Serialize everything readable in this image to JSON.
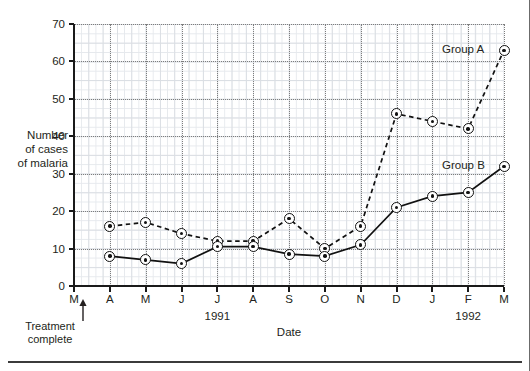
{
  "chart_data": {
    "type": "line",
    "title": "",
    "xlabel": "Date",
    "ylabel": "Number of cases of malaria",
    "ylabel_lines": [
      "Number",
      "of cases",
      "of malaria"
    ],
    "ylim": [
      0,
      70
    ],
    "yticks": [
      0,
      10,
      20,
      30,
      40,
      50,
      60,
      70
    ],
    "grid": true,
    "legend_position": "inline-right",
    "categories": [
      "M",
      "A",
      "M",
      "J",
      "J",
      "A",
      "S",
      "O",
      "N",
      "D",
      "J",
      "F",
      "M"
    ],
    "x": [
      "M",
      "A",
      "M",
      "J",
      "J",
      "A",
      "S",
      "O",
      "N",
      "D",
      "J",
      "F",
      "M"
    ],
    "series": [
      {
        "name": "Group A",
        "style": "dashed",
        "values": [
          null,
          16,
          17,
          14,
          12,
          12,
          18,
          10,
          16,
          46,
          44,
          42,
          63
        ]
      },
      {
        "name": "Group B",
        "style": "solid",
        "values": [
          null,
          8,
          7,
          6,
          10.5,
          10.5,
          8.5,
          8,
          11,
          21,
          24,
          25,
          32
        ]
      }
    ],
    "year_labels": [
      {
        "text": "1991",
        "at_index": 4
      },
      {
        "text": "1992",
        "at_index": 11
      }
    ],
    "annotations": [
      {
        "name": "treatment-complete",
        "lines": [
          "Treatment",
          "complete"
        ],
        "at_index": 0,
        "arrow": "up"
      }
    ]
  },
  "axis": {
    "y_title_lines": [
      "Number",
      "of cases",
      "of malaria"
    ],
    "x_title": "Date",
    "y_ticks": [
      "0",
      "10",
      "20",
      "30",
      "40",
      "50",
      "60",
      "70"
    ],
    "x_ticks": [
      "M",
      "A",
      "M",
      "J",
      "J",
      "A",
      "S",
      "O",
      "N",
      "D",
      "J",
      "F",
      "M"
    ]
  },
  "labels": {
    "group_a": "Group A",
    "group_b": "Group B",
    "year_1991": "1991",
    "year_1992": "1992",
    "treatment_line1": "Treatment",
    "treatment_line2": "complete"
  },
  "colors": {
    "ink": "#231f20",
    "axis": "#1a1a1a",
    "grid_major": "#7d7d7d",
    "grid_minor": "#d9dde2",
    "marker_fill": "#ffffff",
    "marker_stroke": "#111111"
  }
}
